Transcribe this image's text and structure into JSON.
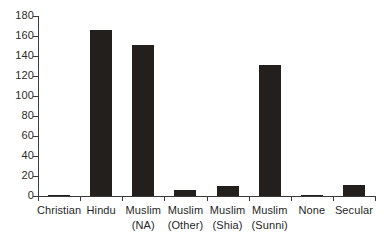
{
  "chart_data": {
    "type": "bar",
    "title": "",
    "xlabel": "",
    "ylabel": "",
    "categories": [
      "Christian",
      "Hindu",
      "Muslim (NA)",
      "Muslim (Other)",
      "Muslim (Shia)",
      "Muslim (Sunni)",
      "None",
      "Secular"
    ],
    "category_lines": [
      {
        "line1": "Christian",
        "line2": ""
      },
      {
        "line1": "Hindu",
        "line2": ""
      },
      {
        "line1": "Muslim",
        "line2": "(NA)"
      },
      {
        "line1": "Muslim",
        "line2": "(Other)"
      },
      {
        "line1": "Muslim",
        "line2": "(Shia)"
      },
      {
        "line1": "Muslim",
        "line2": "(Sunni)"
      },
      {
        "line1": "None",
        "line2": ""
      },
      {
        "line1": "Secular",
        "line2": ""
      }
    ],
    "values": [
      1,
      166,
      151,
      6,
      10,
      131,
      1,
      11
    ],
    "ylim": [
      0,
      180
    ],
    "ytick_labels": [
      "0",
      "20",
      "40",
      "60",
      "80",
      "100",
      "120",
      "140",
      "160",
      "180"
    ],
    "ytick_values": [
      0,
      20,
      40,
      60,
      80,
      100,
      120,
      140,
      160,
      180
    ],
    "grid": false,
    "legend": "none",
    "bar_color": "#231f1c",
    "axis_color": "#3a3a3a",
    "background_color": "#ffffff"
  }
}
